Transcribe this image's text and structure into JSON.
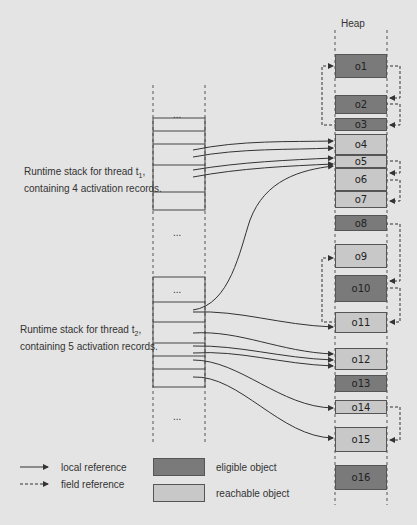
{
  "heap": {
    "title": "Heap",
    "objects": [
      {
        "id": "o1",
        "label": "o1",
        "status": "eligible",
        "top": 54,
        "height": 24
      },
      {
        "id": "o2",
        "label": "o2",
        "status": "eligible",
        "top": 95,
        "height": 19
      },
      {
        "id": "o3",
        "label": "o3",
        "status": "eligible",
        "top": 118,
        "height": 13
      },
      {
        "id": "o4",
        "label": "o4",
        "status": "reachable",
        "top": 134,
        "height": 21
      },
      {
        "id": "o5",
        "label": "o5",
        "status": "reachable",
        "top": 155,
        "height": 13
      },
      {
        "id": "o6",
        "label": "o6",
        "status": "reachable",
        "top": 168,
        "height": 23
      },
      {
        "id": "o7",
        "label": "o7",
        "status": "reachable",
        "top": 191,
        "height": 17
      },
      {
        "id": "o8",
        "label": "o8",
        "status": "eligible",
        "top": 215,
        "height": 16
      },
      {
        "id": "o9",
        "label": "o9",
        "status": "reachable",
        "top": 244,
        "height": 24
      },
      {
        "id": "o10",
        "label": "o10",
        "status": "eligible",
        "top": 275,
        "height": 27
      },
      {
        "id": "o11",
        "label": "o11",
        "status": "reachable",
        "top": 312,
        "height": 21
      },
      {
        "id": "o12",
        "label": "o12",
        "status": "reachable",
        "top": 348,
        "height": 22
      },
      {
        "id": "o13",
        "label": "o13",
        "status": "eligible",
        "top": 375,
        "height": 17
      },
      {
        "id": "o14",
        "label": "o14",
        "status": "reachable",
        "top": 400,
        "height": 14
      },
      {
        "id": "o15",
        "label": "o15",
        "status": "reachable",
        "top": 427,
        "height": 25
      },
      {
        "id": "o16",
        "label": "o16",
        "status": "eligible",
        "top": 465,
        "height": 25
      }
    ]
  },
  "stacks": {
    "ellipsis": "...",
    "t1": {
      "label_line1": "Runtime stack for thread t",
      "label_sub": "1",
      "label_line1_end": ",",
      "label_line2": "containing 4 activation records."
    },
    "t2": {
      "label_line1": "Runtime stack for thread t",
      "label_sub": "2",
      "label_line1_end": ",",
      "label_line2": "containing 5 activation records."
    }
  },
  "field_references": [
    {
      "from": "o1",
      "to": "o2"
    },
    {
      "from": "o2",
      "to": "o3"
    },
    {
      "from": "o3",
      "to": "o1"
    },
    {
      "from": "o5",
      "to": "o6"
    },
    {
      "from": "o6",
      "to": "o7"
    },
    {
      "from": "o8",
      "to": "o10"
    },
    {
      "from": "o10",
      "to": "o11"
    },
    {
      "from": "o11",
      "to": "o9"
    },
    {
      "from": "o14",
      "to": "o15"
    }
  ],
  "local_references": {
    "t1": [
      "o4",
      "o4",
      "o5",
      "o5"
    ],
    "t2": [
      "o5",
      "o11",
      "o12",
      "o12",
      "o12",
      "o14",
      "o15"
    ]
  },
  "legend": {
    "local_reference": "local reference",
    "field_reference": "field reference",
    "eligible_object": "eligible object",
    "reachable_object": "reachable object",
    "colors": {
      "eligible": "#7a7a7a",
      "reachable": "#c8c8c8"
    }
  }
}
